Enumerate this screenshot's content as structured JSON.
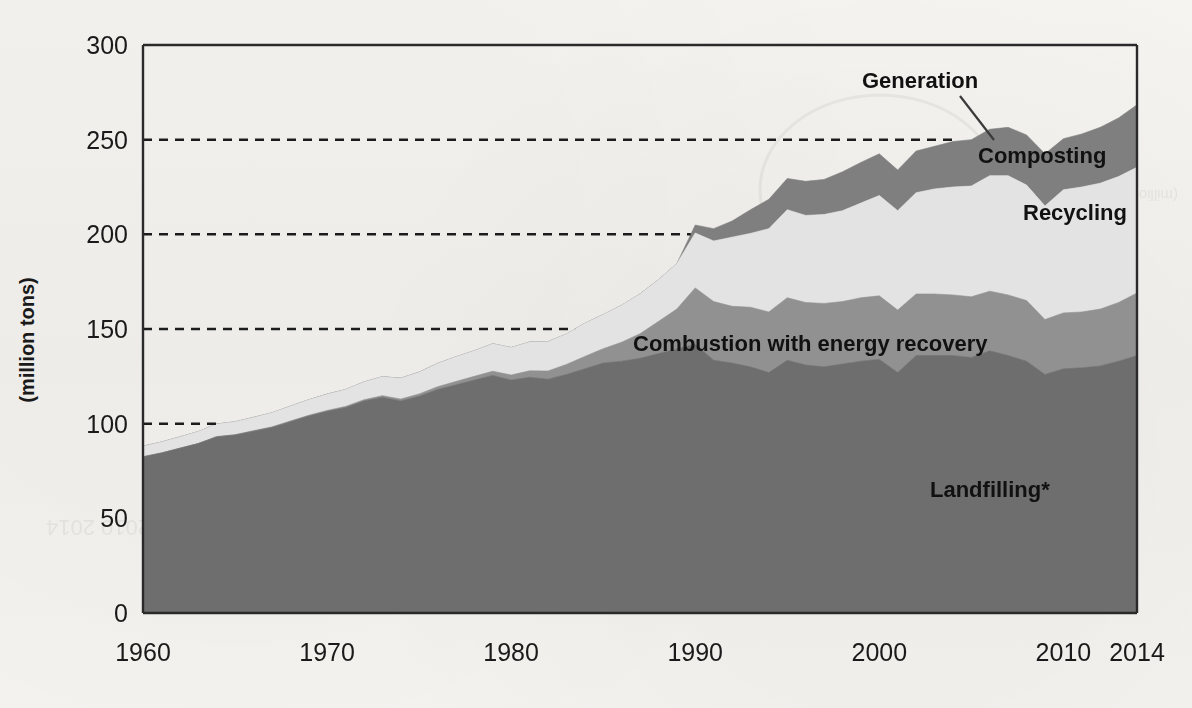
{
  "figure": {
    "y_axis_title": "(million tons)",
    "footnote_marker": "*"
  },
  "labels": {
    "generation": "Generation",
    "composting": "Composting",
    "recycling": "Recycling",
    "combustion": "Combustion with energy recovery",
    "landfilling": "Landfilling*"
  },
  "colors": {
    "landfilling": "#6e6e6e",
    "combustion": "#919191",
    "recycling": "#e3e3e3",
    "composting": "#7f7f7f",
    "background": "#f3f2ef",
    "axis": "#2a2a2a",
    "gridline": "#1c1c1c",
    "text": "#1a1a1a"
  },
  "chart_data": {
    "type": "area",
    "title": "",
    "subtitle": "",
    "xlabel": "",
    "ylabel": "(million tons)",
    "xlim": [
      1960,
      2014
    ],
    "ylim": [
      0,
      300
    ],
    "yticks": [
      0,
      50,
      100,
      150,
      200,
      250,
      300
    ],
    "ytick_labels": [
      "0",
      "50",
      "100",
      "150",
      "200",
      "250",
      "300"
    ],
    "xticks": [
      1960,
      1970,
      1980,
      1990,
      2000,
      2010,
      2014
    ],
    "xtick_labels": [
      "1960",
      "1970",
      "1980",
      "1990",
      "2000",
      "2010",
      "2014"
    ],
    "grid": "horizontal-dashed",
    "legend": "inline-annotations",
    "stacked": true,
    "stack_order": [
      "Landfilling*",
      "Combustion with energy recovery",
      "Recycling",
      "Composting"
    ],
    "x": [
      1960,
      1961,
      1962,
      1963,
      1964,
      1965,
      1966,
      1967,
      1968,
      1969,
      1970,
      1971,
      1972,
      1973,
      1974,
      1975,
      1976,
      1977,
      1978,
      1979,
      1980,
      1981,
      1982,
      1983,
      1984,
      1985,
      1986,
      1987,
      1988,
      1989,
      1990,
      1991,
      1992,
      1993,
      1994,
      1995,
      1996,
      1997,
      1998,
      1999,
      2000,
      2001,
      2002,
      2003,
      2004,
      2005,
      2006,
      2007,
      2008,
      2009,
      2010,
      2011,
      2012,
      2013,
      2014
    ],
    "series": [
      {
        "name": "Landfilling*",
        "color": "#6e6e6e",
        "values": [
          82.5,
          84.5,
          87.0,
          89.5,
          93.0,
          94.0,
          96.0,
          98.0,
          101.0,
          104.0,
          106.5,
          108.5,
          112.0,
          114.0,
          112.0,
          114.5,
          118.0,
          120.5,
          123.0,
          125.5,
          123.0,
          124.5,
          123.5,
          126.0,
          129.0,
          132.0,
          133.0,
          134.5,
          137.0,
          139.5,
          142.0,
          133.5,
          132.0,
          130.0,
          127.0,
          133.5,
          131.0,
          130.0,
          131.5,
          133.0,
          134.0,
          127.0,
          136.0,
          136.0,
          136.0,
          135.0,
          138.5,
          136.0,
          133.0,
          126.0,
          129.0,
          129.5,
          130.5,
          133.0,
          136.0
        ]
      },
      {
        "name": "Combustion with energy recovery",
        "color": "#919191",
        "values": [
          0.0,
          0.0,
          0.0,
          0.0,
          0.2,
          0.2,
          0.3,
          0.3,
          0.4,
          0.4,
          0.5,
          0.6,
          0.6,
          0.8,
          1.0,
          1.2,
          1.5,
          1.8,
          2.0,
          2.2,
          2.7,
          3.4,
          4.3,
          5.3,
          6.5,
          7.6,
          10.0,
          13.0,
          17.0,
          21.0,
          29.7,
          31.0,
          30.0,
          31.5,
          32.0,
          33.0,
          33.0,
          33.5,
          33.0,
          33.5,
          33.5,
          33.0,
          32.5,
          32.5,
          32.0,
          32.0,
          31.5,
          32.0,
          32.0,
          29.0,
          29.5,
          29.5,
          30.0,
          31.0,
          33.0
        ]
      },
      {
        "name": "Recycling",
        "color": "#e3e3e3",
        "values": [
          5.6,
          5.8,
          6.0,
          6.3,
          6.6,
          6.8,
          7.0,
          7.4,
          7.8,
          8.2,
          8.6,
          8.9,
          9.4,
          10.0,
          11.0,
          11.5,
          12.3,
          13.0,
          13.5,
          14.5,
          14.5,
          15.2,
          15.5,
          16.0,
          17.5,
          18.0,
          19.5,
          21.0,
          22.0,
          24.0,
          29.0,
          32.0,
          36.5,
          39.0,
          44.0,
          46.5,
          46.0,
          47.0,
          48.0,
          50.0,
          53.0,
          52.5,
          53.5,
          55.5,
          57.0,
          58.5,
          61.0,
          63.0,
          61.0,
          60.0,
          65.0,
          66.0,
          66.5,
          66.5,
          66.4
        ]
      },
      {
        "name": "Composting",
        "color": "#7f7f7f",
        "values": [
          0,
          0,
          0,
          0,
          0,
          0,
          0,
          0,
          0,
          0,
          0,
          0,
          0,
          0,
          0,
          0,
          0,
          0,
          0,
          0,
          0,
          0,
          0,
          0,
          0,
          0,
          0,
          0,
          0,
          0,
          4.2,
          6.5,
          8.5,
          12.5,
          15.5,
          16.5,
          18.0,
          18.5,
          20.5,
          21.5,
          22.0,
          21.5,
          22.0,
          22.5,
          24.0,
          24.5,
          24.5,
          25.5,
          26.5,
          27.5,
          27.0,
          28.0,
          29.5,
          31.0,
          33.0
        ]
      }
    ],
    "total_label": "Generation",
    "annotations": [
      {
        "text": "Generation",
        "x": 2003,
        "y": 258,
        "leader_to": {
          "x": 2005,
          "y": 254
        }
      },
      {
        "text": "Composting",
        "x": 2007,
        "y": 242
      },
      {
        "text": "Recycling",
        "x": 2007,
        "y": 200
      },
      {
        "text": "Combustion with energy recovery",
        "x": 1998,
        "y": 153
      },
      {
        "text": "Landfilling*",
        "x": 2007,
        "y": 70
      }
    ]
  }
}
